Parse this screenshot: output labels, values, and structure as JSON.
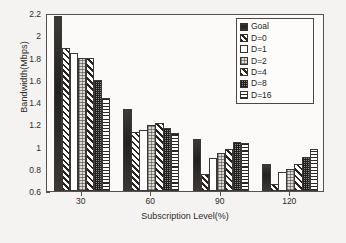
{
  "chart_data": {
    "type": "bar",
    "title": "",
    "xlabel": "Subscription Level(%)",
    "ylabel": "Bandwidth(Mbps)",
    "categories": [
      "30",
      "60",
      "90",
      "120"
    ],
    "ylim": [
      0.6,
      2.2
    ],
    "yticks": [
      "0.6",
      "0.8",
      "1",
      "1.2",
      "1.4",
      "1.6",
      "1.8",
      "2",
      "2.2"
    ],
    "ytick_values": [
      0.6,
      0.8,
      1.0,
      1.2,
      1.4,
      1.6,
      1.8,
      2.0,
      2.2
    ],
    "grid": false,
    "legend_position": "top-right",
    "series": [
      {
        "name": "Goal",
        "pattern": "solid-black",
        "values": [
          2.17,
          1.34,
          1.07,
          0.845
        ]
      },
      {
        "name": "D=0",
        "pattern": "diagonal-hatch",
        "values": [
          1.89,
          1.13,
          0.75,
          0.665
        ]
      },
      {
        "name": "D=1",
        "pattern": "white-empty",
        "values": [
          1.84,
          1.15,
          0.9,
          0.775
        ]
      },
      {
        "name": "D=2",
        "pattern": "light-stipple",
        "values": [
          1.8,
          1.19,
          0.94,
          0.8
        ]
      },
      {
        "name": "D=4",
        "pattern": "diagonal-hatch-alt",
        "values": [
          1.8,
          1.21,
          0.98,
          0.845
        ]
      },
      {
        "name": "D=8",
        "pattern": "dense-checker",
        "values": [
          1.6,
          1.17,
          1.04,
          0.91
        ]
      },
      {
        "name": "D=16",
        "pattern": "horizontal-lines",
        "values": [
          1.435,
          1.125,
          1.03,
          0.975
        ]
      }
    ]
  },
  "legend": {
    "items": [
      {
        "label": "Goal"
      },
      {
        "label": "D=0"
      },
      {
        "label": "D=1"
      },
      {
        "label": "D=2"
      },
      {
        "label": "D=4"
      },
      {
        "label": "D=8"
      },
      {
        "label": "D=16"
      }
    ]
  },
  "colors": {
    "axis": "#55514e",
    "text": "#2f2c2a",
    "plot_background": "#fbfaf8",
    "page_background": "#f4f3f1",
    "bar_outline": "#3a3734",
    "solid_fill": "#2a2724"
  }
}
